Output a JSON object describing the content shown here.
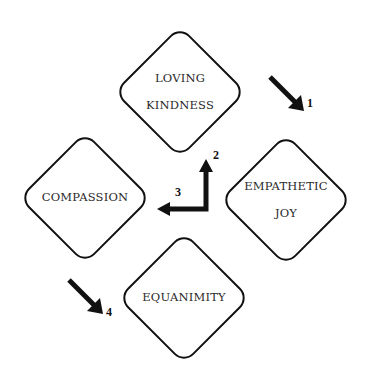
{
  "diagram": {
    "nodes": [
      {
        "id": "loving-kindness",
        "lines": [
          "LOVING",
          "KINDNESS"
        ],
        "center": [
          180,
          92
        ]
      },
      {
        "id": "empathetic-joy",
        "lines": [
          "EMPATHETIC",
          "JOY"
        ],
        "center": [
          286,
          200
        ]
      },
      {
        "id": "compassion",
        "lines": [
          "COMPASSION"
        ],
        "center": [
          85,
          198
        ]
      },
      {
        "id": "equanimity",
        "lines": [
          "EQUANIMITY"
        ],
        "center": [
          184,
          298
        ]
      }
    ],
    "arrows": [
      {
        "label": "1",
        "direction": "down-right"
      },
      {
        "label": "2",
        "direction": "up"
      },
      {
        "label": "3",
        "direction": "left"
      },
      {
        "label": "4",
        "direction": "down-right"
      }
    ],
    "colors": {
      "stroke": "#111111",
      "text": "#2a2a2a",
      "background": "#ffffff"
    }
  }
}
